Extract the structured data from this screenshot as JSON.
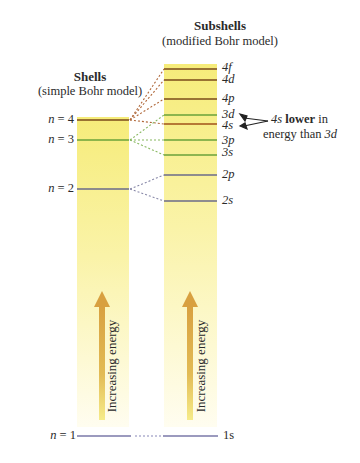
{
  "subshells_header": {
    "title": "Subshells",
    "subtitle": "(modified Bohr model)"
  },
  "shells_header": {
    "title": "Shells",
    "subtitle": "(simple Bohr model)"
  },
  "shells": [
    {
      "n": "n = 4",
      "y": 120,
      "color": "#7a4a1a"
    },
    {
      "n": "n = 3",
      "y": 140,
      "color": "#6aa23a"
    },
    {
      "n": "n = 2",
      "y": 189,
      "color": "#6a6a8a"
    },
    {
      "n": "n = 1",
      "y": 436,
      "color": "#7a78a8"
    }
  ],
  "subshells": [
    {
      "label": "4f",
      "y": 69,
      "color": "#7a4a1a"
    },
    {
      "label": "4d",
      "y": 80,
      "color": "#7a4a1a"
    },
    {
      "label": "4p",
      "y": 99,
      "color": "#7a4a1a"
    },
    {
      "label": "3d",
      "y": 115,
      "color": "#6aa23a"
    },
    {
      "label": "4s",
      "y": 124,
      "color": "#a0521a"
    },
    {
      "label": "3p",
      "y": 140,
      "color": "#6aa23a"
    },
    {
      "label": "3s",
      "y": 155,
      "color": "#6aa23a"
    },
    {
      "label": "2p",
      "y": 175,
      "color": "#6a6a8a"
    },
    {
      "label": "2s",
      "y": 201,
      "color": "#6a6a8a"
    },
    {
      "label": "1s",
      "y": 436,
      "color": "#7a78a8"
    }
  ],
  "annotation": {
    "part1": "4s",
    "bold": "lower",
    "part2": "in",
    "line2a": "energy than",
    "line2b": "3d"
  },
  "arrow_label": "Increasing energy",
  "labels": {
    "n4": "n = 4",
    "n3": "n = 3",
    "n2": "n = 2",
    "n1": "n = 1",
    "s4f": "4f",
    "s4d": "4d",
    "s4p": "4p",
    "s3d": "3d",
    "s4s": "4s",
    "s3p": "3p",
    "s3s": "3s",
    "s2p": "2p",
    "s2s": "2s",
    "s1s": "1s"
  }
}
